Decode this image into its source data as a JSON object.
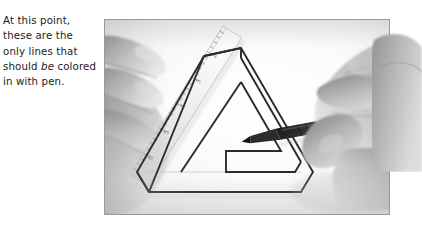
{
  "caption": {
    "lines": [
      {
        "pre": "At this point,",
        "em": "",
        "post": ""
      },
      {
        "pre": "these are the",
        "em": "",
        "post": ""
      },
      {
        "pre": "only lines that",
        "em": "",
        "post": ""
      },
      {
        "pre": "should ",
        "em": "be",
        "post": " colored"
      },
      {
        "pre": "in with pen.",
        "em": "",
        "post": ""
      }
    ],
    "full_text": "At this point, these are the only lines that should be colored in with pen.",
    "color": "#1a1a1a"
  },
  "photo": {
    "border_color": "#9a9a9a",
    "paper_color": "#fdfdfd",
    "subject": "hands drawing a penrose impossible triangle on paper",
    "objects": [
      {
        "name": "left-hand",
        "description": "left hand fingers pressing a ruler onto the paper"
      },
      {
        "name": "ruler",
        "description": "transparent ruler with tick marks and numbers, angled diagonally"
      },
      {
        "name": "right-hand",
        "description": "right hand holding a pen, poised at the drawing"
      },
      {
        "name": "pen",
        "description": "dark fine-tip pen"
      },
      {
        "name": "penrose-triangle",
        "description": "impossible triangle outline drawn in pencil/pen"
      }
    ]
  },
  "drawing": {
    "name": "penrose-triangle",
    "stroke_color": "#2a2a2a",
    "faint_stroke_color": "#c9c9c9",
    "outer": [
      [
        136,
        28
      ],
      [
        203,
        143
      ],
      [
        208,
        152
      ],
      [
        196,
        172
      ],
      [
        44,
        172
      ],
      [
        32,
        152
      ],
      [
        99,
        36
      ]
    ],
    "inner": [
      [
        136,
        62
      ],
      [
        176,
        131
      ],
      [
        121,
        131
      ],
      [
        121,
        152
      ],
      [
        190,
        152
      ],
      [
        196,
        142
      ],
      [
        136,
        38
      ]
    ],
    "faint_lines": [
      [
        [
          32,
          152
        ],
        [
          196,
          152
        ]
      ],
      [
        [
          121,
          131
        ],
        [
          176,
          131
        ]
      ]
    ]
  },
  "ruler": {
    "name": "ruler",
    "tick_count": 26,
    "numbers": [
      "2",
      "3",
      "4",
      "5",
      "6",
      "7"
    ],
    "angle_deg": -58
  }
}
